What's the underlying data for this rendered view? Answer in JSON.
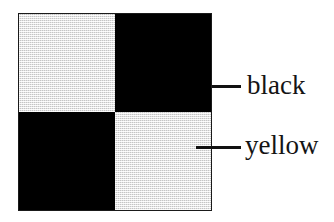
{
  "figure": {
    "type": "checkerboard-diagram",
    "background_color": "#ffffff",
    "title": "",
    "square": {
      "border_color": "#1a1a1a",
      "rows": 2,
      "columns": 2,
      "quadrants": [
        {
          "position": "top-left",
          "fill": "yellow",
          "color": "#e3e3e3"
        },
        {
          "position": "top-right",
          "fill": "black",
          "color": "#000000"
        },
        {
          "position": "bottom-left",
          "fill": "black",
          "color": "#000000"
        },
        {
          "position": "bottom-right",
          "fill": "yellow",
          "color": "#e3e3e3"
        }
      ]
    },
    "annotations": [
      {
        "label": "black",
        "points_to": "top-right",
        "leader": "horizontal-line"
      },
      {
        "label": "yellow",
        "points_to": "bottom-right",
        "leader": "horizontal-line"
      }
    ]
  }
}
